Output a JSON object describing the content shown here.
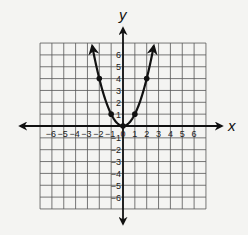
{
  "chart_data": {
    "type": "line",
    "title": "",
    "function": "y = x^2",
    "xlabel": "x",
    "ylabel": "y",
    "xlim": [
      -7,
      7
    ],
    "ylim": [
      -7,
      7
    ],
    "grid": true,
    "x_ticks": [
      -6,
      -5,
      -4,
      -3,
      -2,
      -1,
      0,
      1,
      2,
      3,
      4,
      5,
      6
    ],
    "y_ticks": [
      -6,
      -5,
      -4,
      -3,
      -2,
      -1,
      1,
      2,
      3,
      4,
      5,
      6
    ],
    "points": [
      {
        "x": -2,
        "y": 4
      },
      {
        "x": -1,
        "y": 1
      },
      {
        "x": 0,
        "y": 0
      },
      {
        "x": 1,
        "y": 1
      },
      {
        "x": 2,
        "y": 4
      }
    ],
    "curve_extends_to": {
      "x_min": -2.6,
      "x_max": 2.6
    },
    "arrows": "both curve ends and both axes ends"
  },
  "labels": {
    "x_axis": "x",
    "y_axis": "y",
    "origin": "0"
  },
  "colors": {
    "background": "#f4f4f2",
    "grid": "#555555",
    "axis": "#111111",
    "curve": "#111111"
  }
}
